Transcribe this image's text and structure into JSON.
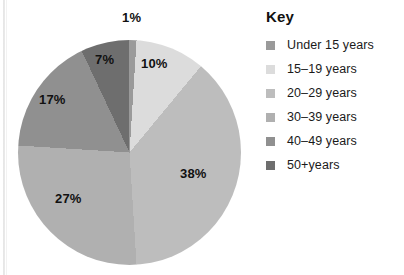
{
  "chart_data": {
    "type": "pie",
    "title": "",
    "legend_title": "Key",
    "legend_position": "right",
    "categories": [
      "Under 15 years",
      "15–19 years",
      "20–29 years",
      "30–39 years",
      "40–49 years",
      "50+years"
    ],
    "values": [
      1,
      10,
      38,
      27,
      17,
      7
    ],
    "unit": "percent",
    "data_labels": [
      "1%",
      "10%",
      "38%",
      "27%",
      "17%",
      "7%"
    ],
    "colors": [
      "#9a9a9a",
      "#dcdcdc",
      "#bdbdbd",
      "#b0b0b0",
      "#909090",
      "#6e6e6e"
    ],
    "start_angle_deg": 0,
    "direction": "clockwise"
  },
  "legend": {
    "title": "Key",
    "items": [
      {
        "label": "Under 15 years",
        "color": "#9a9a9a",
        "value": 1
      },
      {
        "label": "15–19 years",
        "color": "#dcdcdc",
        "value": 10
      },
      {
        "label": "20–29 years",
        "color": "#bdbdbd",
        "value": 38
      },
      {
        "label": "30–39 years",
        "color": "#b0b0b0",
        "value": 27
      },
      {
        "label": "40–49 years",
        "color": "#909090",
        "value": 17
      },
      {
        "label": "50+years",
        "color": "#6e6e6e",
        "value": 7
      }
    ]
  },
  "pie_labels": {
    "under15": "1%",
    "age15_19": "10%",
    "age20_29": "38%",
    "age30_39": "27%",
    "age40_49": "17%",
    "age50plus": "7%"
  }
}
